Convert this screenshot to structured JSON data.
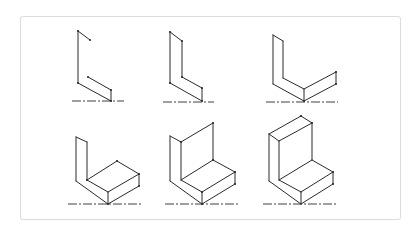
{
  "figure": {
    "colors": {
      "line": "#2a2a2a",
      "border": "#dcdcdc",
      "background": "#ffffff"
    },
    "steps": [
      {
        "id": 1,
        "edges": [
          [
            78,
            31,
            90,
            40
          ],
          [
            78,
            31,
            78,
            83
          ],
          [
            78,
            83,
            111,
            101
          ],
          [
            88,
            77,
            111,
            90
          ],
          [
            111,
            90,
            111,
            101
          ]
        ],
        "points": [
          [
            78,
            31
          ],
          [
            90,
            40
          ],
          [
            78,
            83
          ],
          [
            88,
            77
          ],
          [
            111,
            90
          ],
          [
            111,
            101
          ]
        ],
        "ground": [
          72,
          101,
          124,
          101
        ]
      },
      {
        "id": 2,
        "edges": [
          [
            170,
            32,
            182,
            41
          ],
          [
            170,
            32,
            170,
            83
          ],
          [
            182,
            41,
            182,
            77
          ],
          [
            182,
            77,
            202,
            88
          ],
          [
            170,
            83,
            202,
            101
          ],
          [
            202,
            88,
            202,
            101
          ]
        ],
        "points": [
          [
            170,
            32
          ],
          [
            182,
            41
          ],
          [
            170,
            83
          ],
          [
            182,
            77
          ],
          [
            202,
            88
          ],
          [
            202,
            101
          ]
        ],
        "ground": [
          163,
          102,
          214,
          102
        ]
      },
      {
        "id": 3,
        "edges": [
          [
            273,
            35,
            283,
            41
          ],
          [
            273,
            35,
            273,
            84
          ],
          [
            283,
            41,
            283,
            78
          ],
          [
            283,
            78,
            304,
            89
          ],
          [
            273,
            84,
            304,
            101
          ],
          [
            304,
            89,
            336,
            72
          ],
          [
            304,
            101,
            336,
            84
          ],
          [
            336,
            72,
            336,
            84
          ],
          [
            304,
            89,
            304,
            101
          ]
        ],
        "points": [
          [
            336,
            72
          ],
          [
            336,
            84
          ],
          [
            304,
            101
          ]
        ],
        "ground": [
          266,
          102,
          338,
          102
        ]
      },
      {
        "id": 4,
        "edges": [
          [
            76,
            137,
            87,
            142
          ],
          [
            76,
            137,
            76,
            181
          ],
          [
            87,
            142,
            87,
            180
          ],
          [
            87,
            180,
            108,
            192
          ],
          [
            76,
            181,
            108,
            204
          ],
          [
            87,
            180,
            117,
            161
          ],
          [
            117,
            161,
            139,
            174
          ],
          [
            108,
            192,
            139,
            174
          ],
          [
            108,
            204,
            139,
            186
          ],
          [
            108,
            192,
            108,
            204
          ],
          [
            139,
            174,
            139,
            186
          ]
        ],
        "points": [
          [
            87,
            180
          ],
          [
            117,
            161
          ],
          [
            139,
            174
          ],
          [
            139,
            186
          ],
          [
            108,
            204
          ]
        ],
        "ground": [
          68,
          204,
          142,
          204
        ]
      },
      {
        "id": 5,
        "edges": [
          [
            170,
            136,
            181,
            142
          ],
          [
            181,
            142,
            213,
            123
          ],
          [
            213,
            123,
            213,
            160
          ],
          [
            170,
            136,
            170,
            181
          ],
          [
            181,
            142,
            181,
            180
          ],
          [
            181,
            180,
            213,
            160
          ],
          [
            213,
            160,
            235,
            172
          ],
          [
            181,
            180,
            202,
            192
          ],
          [
            202,
            192,
            235,
            172
          ],
          [
            170,
            181,
            202,
            204
          ],
          [
            202,
            204,
            235,
            184
          ],
          [
            202,
            192,
            202,
            204
          ],
          [
            235,
            172,
            235,
            184
          ]
        ],
        "points": [
          [
            181,
            142
          ],
          [
            213,
            123
          ],
          [
            213,
            160
          ],
          [
            202,
            192
          ],
          [
            235,
            172
          ],
          [
            235,
            184
          ],
          [
            202,
            204
          ]
        ],
        "ground": [
          165,
          204,
          238,
          204
        ]
      },
      {
        "id": 6,
        "edges": [
          [
            269,
            134,
            301,
            116
          ],
          [
            301,
            116,
            312,
            123
          ],
          [
            269,
            134,
            279,
            141
          ],
          [
            279,
            141,
            312,
            123
          ],
          [
            269,
            134,
            269,
            181
          ],
          [
            279,
            141,
            279,
            180
          ],
          [
            312,
            123,
            312,
            160
          ],
          [
            279,
            180,
            312,
            160
          ],
          [
            312,
            160,
            333,
            172
          ],
          [
            279,
            180,
            301,
            192
          ],
          [
            301,
            192,
            333,
            172
          ],
          [
            269,
            181,
            301,
            204
          ],
          [
            301,
            204,
            333,
            184
          ],
          [
            301,
            192,
            301,
            204
          ],
          [
            333,
            172,
            333,
            184
          ]
        ],
        "points": [
          [
            301,
            116
          ],
          [
            312,
            123
          ],
          [
            333,
            172
          ],
          [
            333,
            184
          ]
        ],
        "ground": [
          263,
          204,
          336,
          204
        ]
      }
    ]
  }
}
